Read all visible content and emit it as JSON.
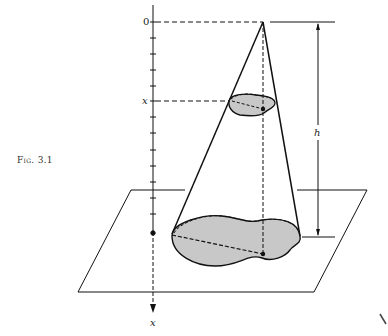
{
  "figure": {
    "caption": "Fig. 3.1",
    "labels": {
      "origin": "0",
      "section_position": "x",
      "axis_label": "x",
      "height": "h"
    },
    "colors": {
      "stroke": "#111111",
      "fill": "#c8c8c8",
      "background": "#ffffff"
    }
  }
}
